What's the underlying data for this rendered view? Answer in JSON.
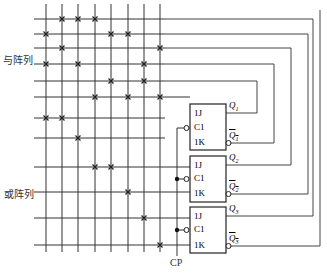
{
  "labels": {
    "and_array": "与阵列",
    "or_array": "或阵列",
    "clock": "CP"
  },
  "flipflops": [
    {
      "j": "1J",
      "c": "C1",
      "k": "1K",
      "q": "Q1",
      "qbar": "Q1"
    },
    {
      "j": "1J",
      "c": "C1",
      "k": "1K",
      "q": "Q2",
      "qbar": "Q2"
    },
    {
      "j": "1J",
      "c": "C1",
      "k": "1K",
      "q": "Q3",
      "qbar": "Q3"
    }
  ],
  "grid": {
    "columns_x": [
      46,
      62,
      78,
      95,
      111,
      128,
      144,
      160
    ],
    "rows_y": [
      19,
      34,
      48,
      64,
      81,
      97,
      118,
      138,
      167,
      192,
      218,
      245
    ],
    "crosses": [
      [
        0,
        [
          1,
          2,
          3
        ]
      ],
      [
        1,
        [
          0,
          4,
          5
        ]
      ],
      [
        2,
        [
          1,
          7
        ]
      ],
      [
        3,
        [
          0,
          2,
          6
        ]
      ],
      [
        4,
        [
          4,
          6
        ]
      ],
      [
        5,
        [
          3,
          5,
          7
        ]
      ],
      [
        6,
        [
          0,
          1
        ]
      ],
      [
        7,
        [
          2
        ]
      ],
      [
        8,
        [
          3,
          4
        ]
      ],
      [
        9,
        [
          5
        ]
      ],
      [
        10,
        [
          6
        ]
      ],
      [
        11,
        [
          7
        ]
      ]
    ]
  },
  "colors": {
    "line": "#333333",
    "box": "#222222"
  }
}
